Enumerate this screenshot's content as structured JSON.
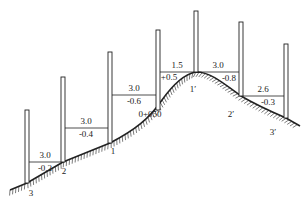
{
  "diagram": {
    "type": "terrain-cross-section-survey",
    "colors": {
      "ink": "#222222",
      "background": "#ffffff"
    },
    "poles": [
      {
        "id": "p-3",
        "x": 27,
        "top": 110,
        "base": 183
      },
      {
        "id": "p-2",
        "x": 63,
        "top": 77,
        "base": 162
      },
      {
        "id": "p-1",
        "x": 110,
        "top": 52,
        "base": 143
      },
      {
        "id": "p-mid",
        "x": 158,
        "top": 30,
        "base": 110
      },
      {
        "id": "p-1p",
        "x": 196,
        "top": 11,
        "base": 72
      },
      {
        "id": "p-2p",
        "x": 241,
        "top": 22,
        "base": 96
      },
      {
        "id": "p-3p",
        "x": 286,
        "top": 44,
        "base": 118
      }
    ],
    "segments": [
      {
        "x1": 27,
        "x2": 63,
        "y": 162,
        "horizontal": "3.0",
        "vertical": "-0.2",
        "hx": 45,
        "hy": 158,
        "vx": 45,
        "vy": 171
      },
      {
        "x1": 63,
        "x2": 110,
        "y": 128,
        "horizontal": "3.0",
        "vertical": "-0.4",
        "hx": 86,
        "hy": 124,
        "vx": 86,
        "vy": 137
      },
      {
        "x1": 110,
        "x2": 158,
        "y": 95,
        "horizontal": "3.0",
        "vertical": "-0.6",
        "hx": 134,
        "hy": 91,
        "vx": 134,
        "vy": 104
      },
      {
        "x1": 158,
        "x2": 196,
        "y": 72,
        "horizontal": "1.5",
        "vertical": "+0.5",
        "hx": 177,
        "hy": 68,
        "vx": 169,
        "vy": 80
      },
      {
        "x1": 196,
        "x2": 241,
        "y": 72,
        "horizontal": "3.0",
        "vertical": "-0.8",
        "hx": 218,
        "hy": 68,
        "vx": 229,
        "vy": 81
      },
      {
        "x1": 241,
        "x2": 286,
        "y": 96,
        "horizontal": "2.6",
        "vertical": "-0.3",
        "hx": 263,
        "hy": 92,
        "vx": 268,
        "vy": 105
      }
    ],
    "point_labels": [
      {
        "text": "3",
        "x": 31,
        "y": 196
      },
      {
        "text": "2",
        "x": 64,
        "y": 174
      },
      {
        "text": "1",
        "x": 113,
        "y": 154
      },
      {
        "text": "0+050",
        "x": 150,
        "y": 117
      },
      {
        "text": "1′",
        "x": 193,
        "y": 92
      },
      {
        "text": "2′",
        "x": 231,
        "y": 117
      },
      {
        "text": "3′",
        "x": 273,
        "y": 135
      }
    ],
    "ground_path": "M 10 190 L 27 183 L 63 162 L 110 143 C 135 130 150 118 162 100 C 172 86 184 74 196 72 C 210 72 222 82 241 96 C 258 106 272 112 286 118 L 300 126"
  }
}
